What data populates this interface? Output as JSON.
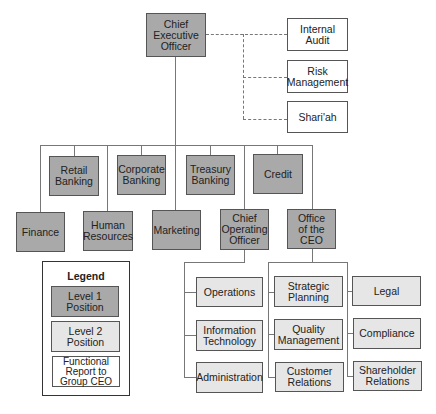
{
  "colors": {
    "level1": "#a9a9a9",
    "level2": "#e6e6e6",
    "functional": "#ffffff",
    "line": "#777777"
  },
  "ceo": {
    "label": "Chief\nExecutive\nOfficer"
  },
  "functional_reports": [
    {
      "label": "Internal\nAudit"
    },
    {
      "label": "Risk\nManagement"
    },
    {
      "label": "Shari'ah"
    }
  ],
  "level1_top_row": [
    {
      "label": "Retail\nBanking"
    },
    {
      "label": "Corporate\nBanking"
    },
    {
      "label": "Treasury\nBanking"
    },
    {
      "label": "Credit"
    }
  ],
  "level1_bottom_row": [
    {
      "label": "Finance"
    },
    {
      "label": "Human\nResources"
    },
    {
      "label": "Marketing"
    },
    {
      "label": "Chief\nOperating\nOfficer"
    },
    {
      "label": "Office\nof the\nCEO"
    }
  ],
  "coo_units": [
    {
      "label": "Operations"
    },
    {
      "label": "Information\nTechnology"
    },
    {
      "label": "Administration"
    }
  ],
  "office_ceo_units_left": [
    {
      "label": "Strategic\nPlanning"
    },
    {
      "label": "Quality\nManagement"
    },
    {
      "label": "Customer\nRelations"
    }
  ],
  "office_ceo_units_right": [
    {
      "label": "Legal"
    },
    {
      "label": "Compliance"
    },
    {
      "label": "Shareholder\nRelations"
    }
  ],
  "legend": {
    "title": "Legend",
    "items": [
      {
        "label": "Level 1\nPosition"
      },
      {
        "label": "Level 2\nPosition"
      },
      {
        "label": "Functional\nReport to\nGroup CEO"
      }
    ]
  }
}
